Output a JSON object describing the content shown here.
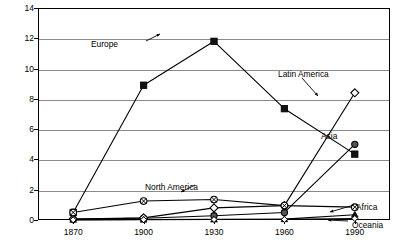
{
  "chart_data": {
    "type": "line",
    "title": "",
    "xlabel": "",
    "ylabel": "Foreign-born Residents (millions)",
    "x": [
      1870,
      1900,
      1930,
      1960,
      1990
    ],
    "xtick_labels": [
      "1870",
      "1900",
      "1930",
      "1960",
      "1990"
    ],
    "ytick_labels": [
      "0",
      "2",
      "4",
      "6",
      "8",
      "10",
      "12",
      "14"
    ],
    "ylim": [
      0,
      14
    ],
    "ytick_step": 2,
    "grid": "horizontal",
    "legend_position": "inline-annotations",
    "series": [
      {
        "name": "Europe",
        "marker": "filled-square",
        "values": [
          0.5,
          8.9,
          11.8,
          7.35,
          4.35
        ]
      },
      {
        "name": "Asia",
        "marker": "filled-circle",
        "values": [
          0.06,
          0.12,
          0.28,
          0.5,
          5.0
        ]
      },
      {
        "name": "Latin America",
        "marker": "open-diamond",
        "values": [
          0.06,
          0.14,
          0.8,
          0.95,
          8.4
        ]
      },
      {
        "name": "North America",
        "marker": "circle-x",
        "values": [
          0.5,
          1.25,
          1.35,
          0.95,
          0.85
        ]
      },
      {
        "name": "Africa",
        "marker": "filled-triangle",
        "values": [
          0.02,
          0.03,
          0.04,
          0.06,
          0.35
        ]
      },
      {
        "name": "Oceania",
        "marker": "open-diamond-small",
        "values": [
          0.01,
          0.02,
          0.03,
          0.04,
          0.1
        ]
      }
    ],
    "annotations": [
      {
        "text": "Europe",
        "x": 118,
        "y": 40
      },
      {
        "text": "Latin America",
        "x": 278,
        "y": 70
      },
      {
        "text": "Asia",
        "x": 321,
        "y": 132
      },
      {
        "text": "North America",
        "x": 198,
        "y": 183
      },
      {
        "text": "Africa",
        "x": 356,
        "y": 203
      },
      {
        "text": "Oceania",
        "x": 352,
        "y": 221
      }
    ]
  }
}
